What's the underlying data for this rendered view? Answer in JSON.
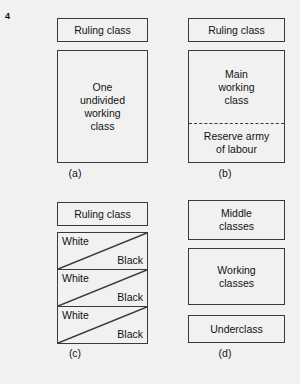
{
  "figure": {
    "number": "4",
    "background_color": "#f1f1f1",
    "line_color": "#3a3a3a",
    "text_color": "#121212"
  },
  "panels": {
    "a": {
      "caption": "(a)",
      "ruling": "Ruling class",
      "working": "One\nundivided\nworking\nclass"
    },
    "b": {
      "caption": "(b)",
      "ruling": "Ruling class",
      "main": "Main\nworking\nclass",
      "reserve": "Reserve army\nof labour"
    },
    "c": {
      "caption": "(c)",
      "ruling": "Ruling class",
      "segments": [
        {
          "white": "White",
          "black": "Black"
        },
        {
          "white": "White",
          "black": "Black"
        },
        {
          "white": "White",
          "black": "Black"
        }
      ]
    },
    "d": {
      "caption": "(d)",
      "middle": "Middle\nclasses",
      "working": "Working\nclasses",
      "underclass": "Underclass"
    }
  }
}
